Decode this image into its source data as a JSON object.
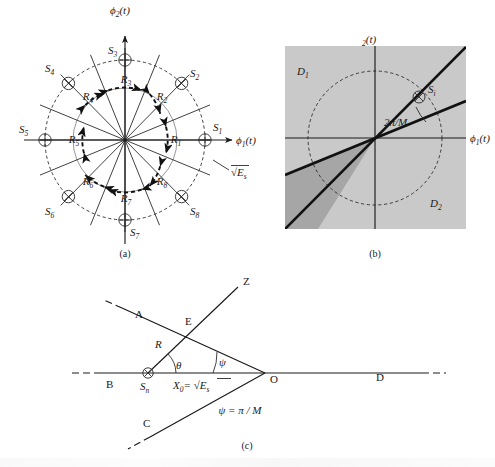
{
  "figure": {
    "title_present": false,
    "panels": [
      {
        "id": "a",
        "caption": "(a)"
      },
      {
        "id": "b",
        "caption": "(b)"
      },
      {
        "id": "c",
        "caption": "(c)"
      }
    ]
  },
  "panel_a": {
    "caption": "(a)",
    "axis_x_label": "ϕ",
    "axis_x_sub": "1",
    "axis_x_tail": "(t)",
    "axis_y_label": "ϕ",
    "axis_y_sub": "2",
    "axis_y_tail": "(t)",
    "radius_label": "√E",
    "radius_sub": "s",
    "signal_points": [
      {
        "name": "S",
        "sub": "1",
        "glyph": "circle-plus",
        "angle_deg": 0
      },
      {
        "name": "S",
        "sub": "2",
        "glyph": "circle-times",
        "angle_deg": 45
      },
      {
        "name": "S",
        "sub": "3",
        "glyph": "circle-plus",
        "angle_deg": 90
      },
      {
        "name": "S",
        "sub": "4",
        "glyph": "circle-times",
        "angle_deg": 135
      },
      {
        "name": "S",
        "sub": "5",
        "glyph": "circle-plus",
        "angle_deg": 180
      },
      {
        "name": "S",
        "sub": "6",
        "glyph": "circle-times",
        "angle_deg": 225
      },
      {
        "name": "S",
        "sub": "7",
        "glyph": "circle-plus",
        "angle_deg": 270
      },
      {
        "name": "S",
        "sub": "8",
        "glyph": "circle-times",
        "angle_deg": 315
      }
    ],
    "decision_regions": [
      {
        "name": "R",
        "sub": "1",
        "angle_deg": 0
      },
      {
        "name": "R",
        "sub": "2",
        "angle_deg": 45
      },
      {
        "name": "R",
        "sub": "3",
        "angle_deg": 90
      },
      {
        "name": "R",
        "sub": "4",
        "angle_deg": 135
      },
      {
        "name": "R",
        "sub": "5",
        "angle_deg": 180
      },
      {
        "name": "R",
        "sub": "6",
        "angle_deg": 225
      },
      {
        "name": "R",
        "sub": "7",
        "angle_deg": 270
      },
      {
        "name": "R",
        "sub": "8",
        "angle_deg": 315
      }
    ],
    "num_signals": 8,
    "boundary_count": 8
  },
  "panel_b": {
    "caption": "(b)",
    "axis_x_label": "ϕ",
    "axis_x_sub": "1",
    "axis_x_tail": "(t)",
    "axis_y_label": "",
    "axis_y_sub": "2",
    "axis_y_tail": "(t)",
    "region_1": "D",
    "region_1_sub": "1",
    "region_2": "D",
    "region_2_sub": "2",
    "angle_label": "2π/M",
    "signal_point": "S",
    "signal_point_sub": "i",
    "signal_glyph": "circle-times",
    "bg_color": "#c9c9c9",
    "wedge_color": "#a6a6a6"
  },
  "panel_c": {
    "caption": "(c)",
    "vertex_labels": [
      {
        "name": "A",
        "kind": "ray-label"
      },
      {
        "name": "B",
        "kind": "ray-label"
      },
      {
        "name": "C",
        "kind": "ray-label"
      },
      {
        "name": "D",
        "kind": "ray-label"
      },
      {
        "name": "Z",
        "kind": "ray-label"
      },
      {
        "name": "E",
        "kind": "point-label"
      },
      {
        "name": "O",
        "kind": "point-label"
      }
    ],
    "radius_label": "R",
    "theta_label": "θ",
    "psi_label": "ψ",
    "origin_point": "S",
    "origin_point_sub": "n",
    "distance_label": "X",
    "distance_sub": "0",
    "distance_value": "= √E",
    "distance_value_sub": "s",
    "note": "ψ = π / M"
  }
}
